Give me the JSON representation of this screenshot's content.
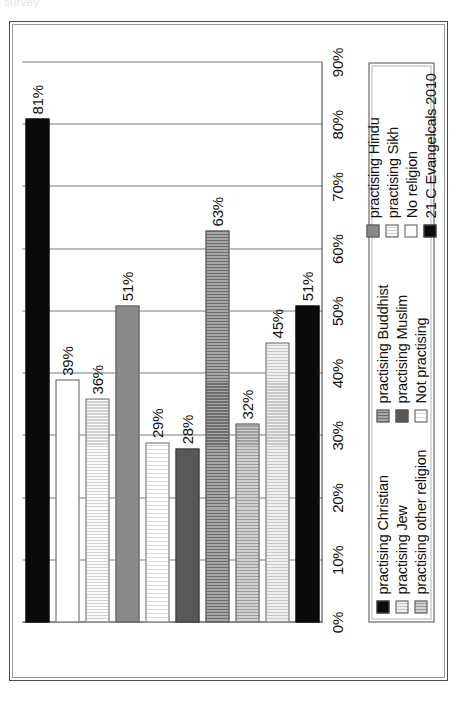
{
  "scan": {
    "top_fragment": "survey"
  },
  "chart_data": {
    "type": "bar",
    "orientation": "horizontal-rotated",
    "title": "",
    "subtitle": "",
    "xlabel": "",
    "ylabel": "",
    "xlim": [
      0,
      90
    ],
    "grid": true,
    "legend_position": "bottom",
    "axis_ticks": [
      "90%",
      "80%",
      "70%",
      "60%",
      "50%",
      "40%",
      "30%",
      "20%",
      "10%",
      "0%"
    ],
    "axis_tick_values": [
      90,
      80,
      70,
      60,
      50,
      40,
      30,
      20,
      10,
      0
    ],
    "categories": [
      "practising Christian",
      "practising Jew",
      "practising other religion",
      "practising Buddhist",
      "practising Muslim",
      "Not practising",
      "practising Hindu",
      "practising Sikh",
      "No religion",
      "21 C Evangelcals 2010"
    ],
    "bars": [
      {
        "label": "81%",
        "value": 81,
        "fill": "f-black",
        "series": "21 C Evangelcals 2010"
      },
      {
        "label": "39%",
        "value": 39,
        "fill": "f-white",
        "series": "No religion"
      },
      {
        "label": "36%",
        "value": 36,
        "fill": "f-vstripe-light",
        "series": "practising Sikh"
      },
      {
        "label": "51%",
        "value": 51,
        "fill": "f-gray-mid",
        "series": "practising Hindu"
      },
      {
        "label": "29%",
        "value": 29,
        "fill": "f-vstripe-vlight",
        "series": "Not practising"
      },
      {
        "label": "28%",
        "value": 28,
        "fill": "f-gray-dark",
        "series": "practising Muslim"
      },
      {
        "label": "63%",
        "value": 63,
        "fill": "f-vstripe-mid",
        "series": "practising Buddhist"
      },
      {
        "label": "32%",
        "value": 32,
        "fill": "f-vstripe-gray",
        "series": "practising other religion"
      },
      {
        "label": "45%",
        "value": 45,
        "fill": "f-vstripe-pale",
        "series": "practising Jew"
      },
      {
        "label": "51%",
        "value": 51,
        "fill": "f-black",
        "series": "practising Christian"
      }
    ],
    "values": [
      81,
      39,
      36,
      51,
      29,
      28,
      63,
      32,
      45,
      51
    ]
  },
  "legend": {
    "columns": [
      {
        "items": [
          {
            "label": "practising Christian",
            "fill": "f-black"
          },
          {
            "label": "practising Jew",
            "fill": "f-vstripe-pale"
          },
          {
            "label": "practising other religion",
            "fill": "f-vstripe-gray"
          }
        ]
      },
      {
        "items": [
          {
            "label": "practising Buddhist",
            "fill": "f-vstripe-mid"
          },
          {
            "label": "practising Muslim",
            "fill": "f-gray-dark"
          },
          {
            "label": "Not practising",
            "fill": "f-vstripe-vlight"
          }
        ]
      },
      {
        "items": [
          {
            "label": "practising Hindu",
            "fill": "f-gray-mid"
          },
          {
            "label": "practising Sikh",
            "fill": "f-vstripe-light"
          },
          {
            "label": "No religion",
            "fill": "f-white"
          },
          {
            "label": "21 C Evangelcals 2010",
            "fill": "f-black"
          }
        ]
      }
    ]
  },
  "colors": {
    "black": "#0a0a0a",
    "gray_dark": "#585858",
    "gray_mid": "#8a8a8a",
    "gray_light": "#c4c4c4",
    "white": "#ffffff",
    "grid": "#7a7a7a",
    "axis": "#3a3a3a"
  }
}
